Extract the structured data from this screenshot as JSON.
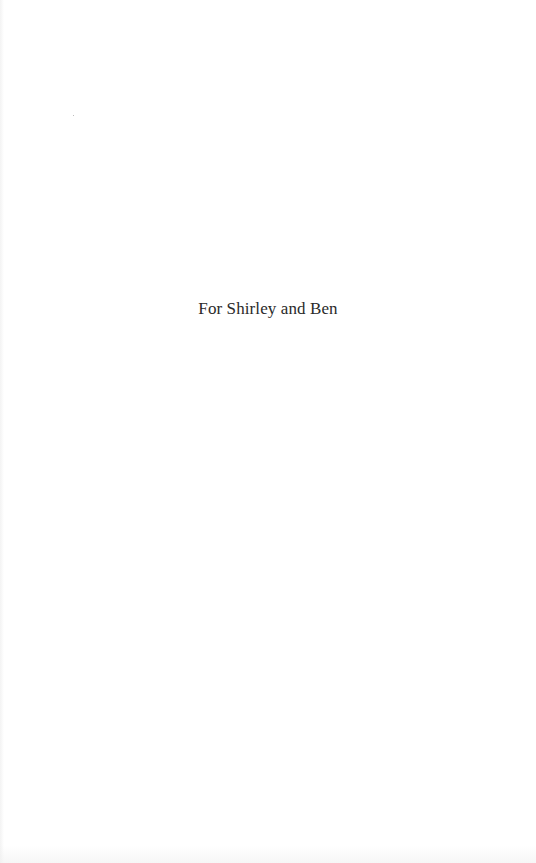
{
  "page": {
    "type": "dedication",
    "dedication_text": "For Shirley and Ben"
  },
  "colors": {
    "background": "#ffffff",
    "text": "#2a2a2a"
  }
}
